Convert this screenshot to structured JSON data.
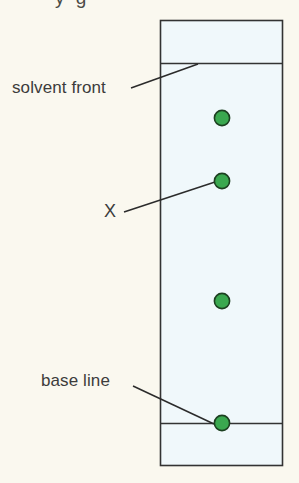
{
  "figure": {
    "title_clipped": "y      g",
    "background_color": "#faf8ef",
    "plate": {
      "name": "tlc-plate",
      "fill_color": "#f0f8fb",
      "border_color": "#333333",
      "x": 160,
      "y": 20,
      "width": 122,
      "height": 445
    },
    "lines": [
      {
        "name": "solvent-front-line",
        "label": "solvent front",
        "y": 63,
        "color": "#333333"
      },
      {
        "name": "base-line",
        "label": "base line",
        "y": 423,
        "color": "#333333"
      }
    ],
    "spots": [
      {
        "name": "spot-1",
        "cx": 222,
        "cy": 118,
        "r": 8,
        "fill": "#3aa84f",
        "stroke": "#1c4020"
      },
      {
        "name": "spot-2",
        "cx": 222,
        "cy": 181,
        "r": 8,
        "fill": "#3aa84f",
        "stroke": "#1c4020"
      },
      {
        "name": "spot-3",
        "cx": 222,
        "cy": 301,
        "r": 8,
        "fill": "#3aa84f",
        "stroke": "#1c4020"
      },
      {
        "name": "spot-4",
        "cx": 222,
        "cy": 423,
        "r": 8,
        "fill": "#3aa84f",
        "stroke": "#1c4020"
      }
    ],
    "labels": {
      "solvent_front": "solvent front",
      "x_marker": "X",
      "base_line": "base line"
    },
    "leader_lines": [
      {
        "name": "leader-solvent-front",
        "x1": 131,
        "y1": 88,
        "x2": 198,
        "y2": 64
      },
      {
        "name": "leader-x",
        "x1": 124,
        "y1": 212,
        "x2": 215,
        "y2": 182
      },
      {
        "name": "leader-base-line",
        "x1": 133,
        "y1": 386,
        "x2": 214,
        "y2": 424
      }
    ],
    "colors": {
      "spot_green": "#3aa84f",
      "spot_outline": "#1c4020",
      "plate_fill": "#f0f8fb",
      "plate_border": "#333333",
      "text": "#3c3c3c",
      "page_background": "#faf8ef"
    }
  }
}
